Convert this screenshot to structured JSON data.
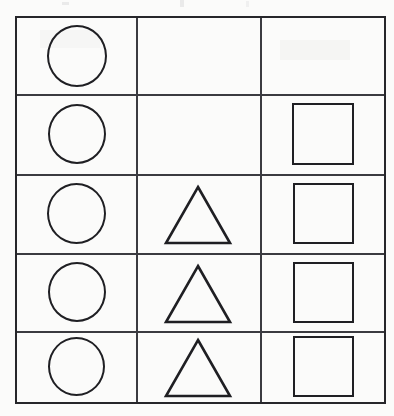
{
  "page": {
    "width": 394,
    "height": 416,
    "background_color": "#fbfbfa",
    "ink_color": "#1f1f23",
    "grid_line_color": "#3b3b40"
  },
  "grid": {
    "name": "shape-grid",
    "columns": 3,
    "rows": 5,
    "bounds": {
      "left": 15,
      "top": 16,
      "width": 371,
      "height": 388
    },
    "column_dividers_x": [
      136,
      260
    ],
    "row_dividers_y": [
      94,
      174,
      253,
      331
    ],
    "column_labels": [
      "circle-column",
      "triangle-column",
      "square-column"
    ],
    "cells": [
      {
        "row": 1,
        "col": 1,
        "shape": "circle",
        "label": "circle",
        "size": 60
      },
      {
        "row": 1,
        "col": 2,
        "shape": "none",
        "label": "empty",
        "size": 0
      },
      {
        "row": 1,
        "col": 3,
        "shape": "none",
        "label": "empty",
        "size": 0
      },
      {
        "row": 2,
        "col": 1,
        "shape": "circle",
        "label": "circle",
        "size": 58
      },
      {
        "row": 2,
        "col": 2,
        "shape": "none",
        "label": "empty",
        "size": 0
      },
      {
        "row": 2,
        "col": 3,
        "shape": "square",
        "label": "square",
        "size": 62
      },
      {
        "row": 3,
        "col": 1,
        "shape": "circle",
        "label": "circle",
        "size": 59
      },
      {
        "row": 3,
        "col": 2,
        "shape": "triangle",
        "label": "triangle",
        "size": 60
      },
      {
        "row": 3,
        "col": 3,
        "shape": "square",
        "label": "square",
        "size": 61
      },
      {
        "row": 4,
        "col": 1,
        "shape": "circle",
        "label": "circle",
        "size": 58
      },
      {
        "row": 4,
        "col": 2,
        "shape": "triangle",
        "label": "triangle",
        "size": 60
      },
      {
        "row": 4,
        "col": 3,
        "shape": "square",
        "label": "square",
        "size": 61
      },
      {
        "row": 5,
        "col": 1,
        "shape": "circle",
        "label": "circle",
        "size": 57
      },
      {
        "row": 5,
        "col": 2,
        "shape": "triangle",
        "label": "triangle",
        "size": 60
      },
      {
        "row": 5,
        "col": 3,
        "shape": "square",
        "label": "square",
        "size": 61
      }
    ],
    "counts": {
      "circles": 5,
      "triangles": 3,
      "squares": 4
    }
  },
  "artifacts": {
    "description": "faint scanner marks along the top margin",
    "marks": [
      {
        "left": 62,
        "top": 2,
        "width": 7,
        "height": 3
      },
      {
        "left": 180,
        "top": 0,
        "width": 4,
        "height": 7
      },
      {
        "left": 246,
        "top": 1,
        "width": 3,
        "height": 6
      }
    ]
  }
}
